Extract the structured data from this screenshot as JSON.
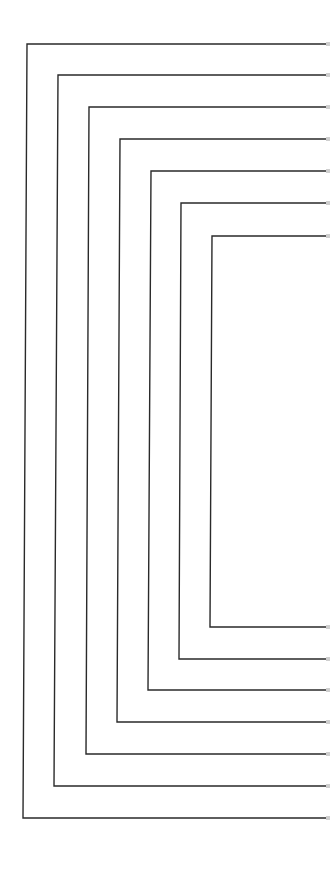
{
  "figure": {
    "stroke_color": "#2a2a2a",
    "background": "#ffffff",
    "right_edge_x": 326,
    "brackets": [
      {
        "id": 1,
        "top_y": 44,
        "bottom_y": 818,
        "left_top_x": 27,
        "left_bottom_x": 23
      },
      {
        "id": 2,
        "top_y": 75,
        "bottom_y": 786,
        "left_top_x": 58,
        "left_bottom_x": 54
      },
      {
        "id": 3,
        "top_y": 107,
        "bottom_y": 754,
        "left_top_x": 89,
        "left_bottom_x": 86
      },
      {
        "id": 4,
        "top_y": 139,
        "bottom_y": 722,
        "left_top_x": 120,
        "left_bottom_x": 117
      },
      {
        "id": 5,
        "top_y": 171,
        "bottom_y": 690,
        "left_top_x": 151,
        "left_bottom_x": 148
      },
      {
        "id": 6,
        "top_y": 203,
        "bottom_y": 659,
        "left_top_x": 181,
        "left_bottom_x": 179
      },
      {
        "id": 7,
        "top_y": 236,
        "bottom_y": 627,
        "left_top_x": 212,
        "left_bottom_x": 210
      }
    ]
  }
}
